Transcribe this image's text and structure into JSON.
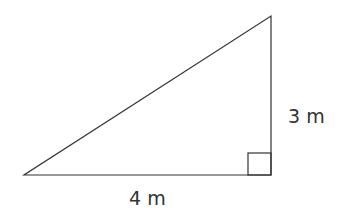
{
  "diagram": {
    "type": "right-triangle",
    "vertices": {
      "left": [
        24,
        175
      ],
      "right_angle": [
        271,
        175
      ],
      "top": [
        271,
        16
      ]
    },
    "right_angle_marker": {
      "x": 247,
      "y": 153,
      "size": 23
    },
    "stroke_color": "#333333",
    "labels": {
      "vertical_side": "3 m",
      "horizontal_side": "4 m"
    }
  }
}
